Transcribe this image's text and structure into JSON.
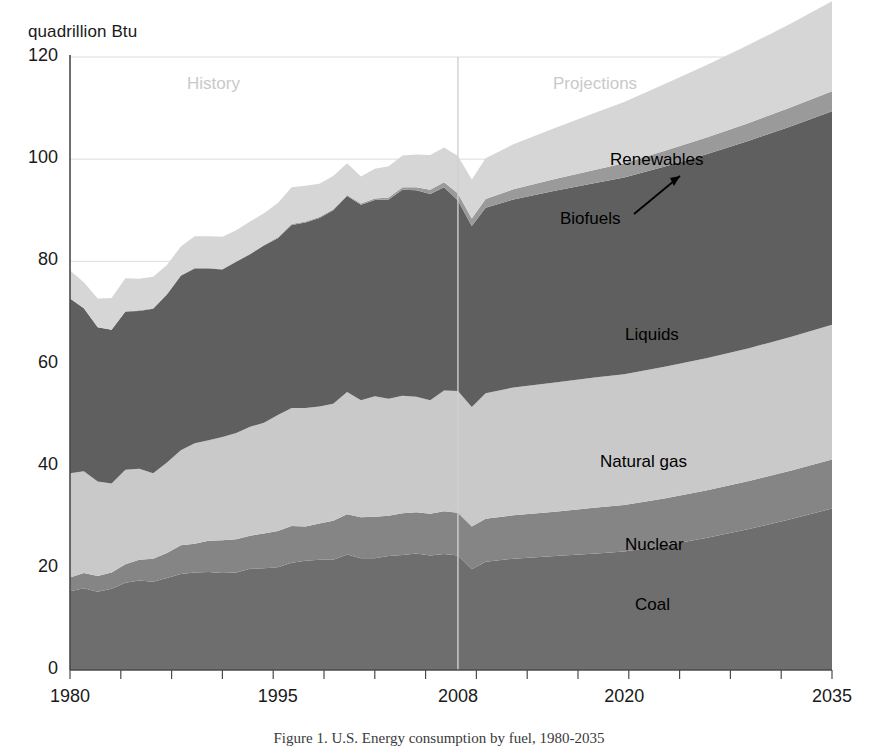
{
  "figure": {
    "y_axis_unit": "quadrillion Btu",
    "caption": "Figure 1. U.S. Energy consumption by fuel, 1980-2035"
  },
  "annotations": {
    "history": "History",
    "projections": "Projections",
    "divider_year": 2008
  },
  "series_labels": {
    "renewables": "Renewables",
    "biofuels": "Biofuels",
    "liquids": "Liquids",
    "natural_gas": "Natural gas",
    "nuclear": "Nuclear",
    "coal": "Coal"
  },
  "colors": {
    "coal": "#6e6e6e",
    "nuclear": "#858585",
    "natural_gas": "#c9c9c9",
    "liquids": "#5f5f5f",
    "biofuels": "#9a9a9a",
    "renewables": "#d6d6d6",
    "gridline": "#dcdcdc",
    "axis": "#4a4a4a",
    "divider": "#d0d0d0",
    "annotation_gray": "#c9c9c9"
  },
  "chart_data": {
    "type": "area",
    "stacked": true,
    "title": "U.S. Energy consumption by fuel",
    "xlabel": "",
    "ylabel": "quadrillion Btu",
    "xlim": [
      1980,
      2035
    ],
    "ylim": [
      0,
      120
    ],
    "ytick_values": [
      0,
      20,
      40,
      60,
      80,
      100,
      120
    ],
    "xtick_values": [
      1980,
      1995,
      2008,
      2020,
      2035
    ],
    "grid": "horizontal",
    "legend": "inline-area-labels",
    "x": [
      1980,
      1981,
      1982,
      1983,
      1984,
      1985,
      1986,
      1987,
      1988,
      1989,
      1990,
      1991,
      1992,
      1993,
      1994,
      1995,
      1996,
      1997,
      1998,
      1999,
      2000,
      2001,
      2002,
      2003,
      2004,
      2005,
      2006,
      2007,
      2008,
      2009,
      2010,
      2012,
      2015,
      2018,
      2020,
      2023,
      2026,
      2029,
      2032,
      2035
    ],
    "series": [
      {
        "name": "Coal",
        "values": [
          15.4,
          16.0,
          15.3,
          15.9,
          17.1,
          17.5,
          17.3,
          18.0,
          18.8,
          19.1,
          19.2,
          19.0,
          19.1,
          19.8,
          19.9,
          20.1,
          21.0,
          21.4,
          21.6,
          21.6,
          22.6,
          21.9,
          21.9,
          22.3,
          22.5,
          22.8,
          22.4,
          22.7,
          22.4,
          19.7,
          21.2,
          21.8,
          22.3,
          22.8,
          23.2,
          24.4,
          25.9,
          27.6,
          29.5,
          31.6
        ]
      },
      {
        "name": "Nuclear",
        "values": [
          2.7,
          3.0,
          3.1,
          3.2,
          3.6,
          4.1,
          4.5,
          4.9,
          5.6,
          5.6,
          6.1,
          6.4,
          6.5,
          6.5,
          6.8,
          7.1,
          7.2,
          6.7,
          7.1,
          7.6,
          7.9,
          8.0,
          8.1,
          7.9,
          8.2,
          8.1,
          8.2,
          8.4,
          8.4,
          8.4,
          8.4,
          8.5,
          8.7,
          9.0,
          9.1,
          9.2,
          9.3,
          9.4,
          9.5,
          9.6
        ]
      },
      {
        "name": "Natural gas",
        "values": [
          20.4,
          19.9,
          18.5,
          17.4,
          18.5,
          17.8,
          16.7,
          17.7,
          18.6,
          19.7,
          19.7,
          20.2,
          20.8,
          21.3,
          21.7,
          22.7,
          23.1,
          23.2,
          22.9,
          22.9,
          23.9,
          22.9,
          23.6,
          22.9,
          23.0,
          22.6,
          22.2,
          23.6,
          23.8,
          23.4,
          24.6,
          25.0,
          25.3,
          25.5,
          25.6,
          25.8,
          25.9,
          26.0,
          26.2,
          26.4
        ]
      },
      {
        "name": "Liquids",
        "values": [
          34.2,
          31.9,
          30.2,
          30.1,
          31.0,
          30.9,
          32.2,
          32.9,
          34.2,
          34.2,
          33.6,
          32.8,
          33.5,
          33.8,
          34.7,
          34.6,
          35.8,
          36.3,
          36.9,
          37.9,
          38.4,
          38.3,
          38.4,
          39.0,
          40.3,
          40.4,
          40.4,
          39.8,
          37.3,
          35.4,
          36.3,
          36.8,
          37.5,
          38.1,
          38.5,
          39.2,
          39.9,
          40.6,
          41.2,
          41.8
        ]
      },
      {
        "name": "Biofuels",
        "values": [
          0.0,
          0.0,
          0.0,
          0.0,
          0.0,
          0.1,
          0.1,
          0.1,
          0.1,
          0.1,
          0.1,
          0.1,
          0.1,
          0.1,
          0.1,
          0.2,
          0.2,
          0.2,
          0.2,
          0.2,
          0.2,
          0.2,
          0.3,
          0.4,
          0.5,
          0.6,
          0.8,
          1.0,
          1.4,
          1.5,
          1.7,
          2.0,
          2.3,
          2.6,
          2.8,
          3.1,
          3.3,
          3.5,
          3.7,
          3.9
        ]
      },
      {
        "name": "Renewables",
        "values": [
          5.5,
          5.1,
          5.6,
          6.2,
          6.5,
          6.2,
          6.2,
          5.7,
          5.6,
          6.2,
          6.2,
          6.3,
          6.1,
          6.3,
          6.2,
          6.7,
          7.2,
          7.0,
          6.5,
          6.5,
          6.2,
          5.3,
          5.8,
          6.1,
          6.2,
          6.4,
          6.8,
          6.8,
          7.3,
          7.6,
          8.0,
          8.8,
          10.0,
          11.2,
          12.0,
          13.1,
          14.2,
          15.3,
          16.4,
          17.6
        ]
      }
    ]
  },
  "label_positions": {
    "renewables": {
      "x": 610,
      "y": 150
    },
    "biofuels": {
      "x": 560,
      "y": 209
    },
    "liquids": {
      "x": 625,
      "y": 325
    },
    "natural_gas": {
      "x": 600,
      "y": 452
    },
    "nuclear": {
      "x": 625,
      "y": 535
    },
    "coal": {
      "x": 635,
      "y": 595
    }
  }
}
